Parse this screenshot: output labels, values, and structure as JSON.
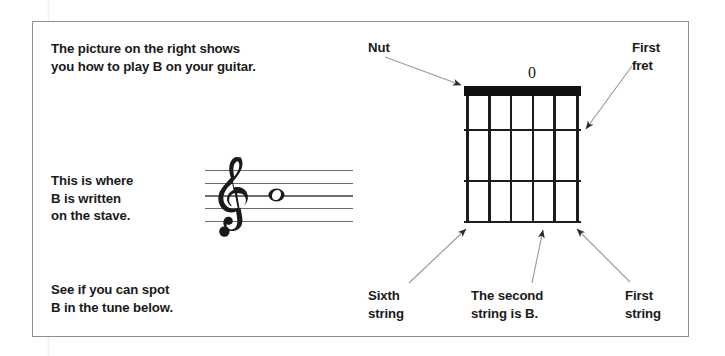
{
  "page": {
    "background_color": "#ffffff",
    "border_color": "#8e8e8e"
  },
  "body_text": {
    "intro": "The picture on the right shows\nyou how to play B on your guitar.",
    "stave_note": "This is where\nB is written\non the stave.",
    "tune_prompt": "See if you can spot\nB in the tune below."
  },
  "stave": {
    "clef": "treble-clef",
    "line_count": 5,
    "note": {
      "name": "B",
      "type": "whole-note",
      "position": "middle line (3rd line)"
    }
  },
  "fretboard": {
    "open_string_marker": "0",
    "string_count": 6,
    "fret_count": 3,
    "nut_color": "#111111",
    "line_color": "#1d1d1d",
    "strings": [
      "Sixth",
      "Fifth",
      "Fourth",
      "Third",
      "Second",
      "First"
    ]
  },
  "callouts": {
    "nut": "Nut",
    "first_fret": "First\nfret",
    "sixth_string": "Sixth\nstring",
    "second_string": "The second\nstring is B.",
    "first_string": "First\nstring"
  }
}
